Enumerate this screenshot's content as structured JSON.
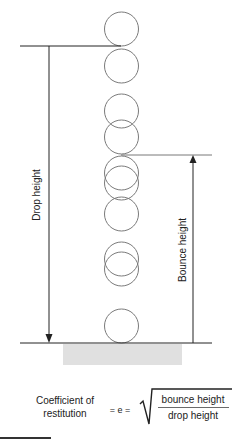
{
  "diagram": {
    "colors": {
      "ball_stroke": "#7a7a7a",
      "line": "#222222",
      "floor": "#e0e0e0",
      "text": "#222222"
    },
    "labels": {
      "drop_height": "Drop height",
      "bounce_height": "Bounce height"
    },
    "balls": [
      {
        "cx": 121.5,
        "cy": 29
      },
      {
        "cx": 121.5,
        "cy": 66
      },
      {
        "cx": 121.5,
        "cy": 111
      },
      {
        "cx": 121.5,
        "cy": 137
      },
      {
        "cx": 121.5,
        "cy": 183
      },
      {
        "cx": 121.5,
        "cy": 173
      },
      {
        "cx": 121.5,
        "cy": 214
      },
      {
        "cx": 121.5,
        "cy": 269
      },
      {
        "cx": 121.5,
        "cy": 259
      },
      {
        "cx": 121.5,
        "cy": 326
      }
    ],
    "ball_radius": 17,
    "formula": {
      "left_line1": "Coefficient of",
      "left_line2": "restitution",
      "equals": "= e =",
      "numerator": "bounce height",
      "denominator": "drop height"
    }
  }
}
